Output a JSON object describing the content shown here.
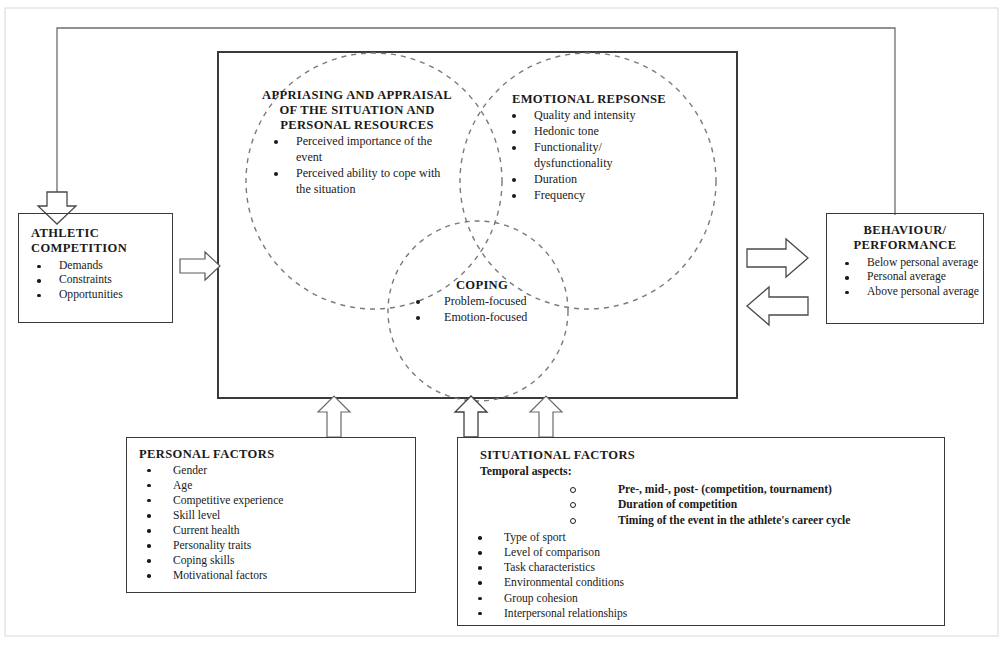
{
  "diagram": {
    "title_present": false,
    "central_box": {
      "name": "appraisal-process-container",
      "circles": [
        {
          "id": "appraisal",
          "heading": "APPRIASING AND APPRAISAL OF THE SITUATION AND PERSONAL RESOURCES",
          "items": [
            "Perceived importance of the event",
            "Perceived ability to cope with the situation"
          ]
        },
        {
          "id": "emotional-response",
          "heading": "EMOTIONAL REPSONSE",
          "items": [
            "Quality and intensity",
            "Hedonic tone",
            "Functionality/ dysfunctionality",
            "Duration",
            "Frequency"
          ]
        },
        {
          "id": "coping",
          "heading": "COPING",
          "items": [
            "Problem-focused",
            "Emotion-focused"
          ]
        }
      ]
    },
    "athletic_competition": {
      "title": "ATHLETIC COMPETITION",
      "items": [
        "Demands",
        "Constraints",
        "Opportunities"
      ]
    },
    "behaviour_performance": {
      "title": "BEHAVIOUR/ PERFORMANCE",
      "items": [
        "Below personal average",
        "Personal average",
        "Above personal average"
      ]
    },
    "personal_factors": {
      "title": "PERSONAL FACTORS",
      "items": [
        "Gender",
        "Age",
        "Competitive experience",
        "Skill level",
        "Current health",
        "Personality traits",
        "Coping skills",
        "Motivational factors"
      ]
    },
    "situational_factors": {
      "title": "SITUATIONAL FACTORS",
      "subheading": "Temporal aspects:",
      "temporal_items": [
        "Pre-, mid-, post- (competition, tournament)",
        "Duration of competition",
        "Timing of the event in the athlete's career cycle"
      ],
      "items": [
        "Type of sport",
        "Level of comparison",
        "Task characteristics",
        "Environmental conditions",
        "Group cohesion",
        "Interpersonal relationships"
      ]
    },
    "connectors": [
      {
        "id": "feedback-loop",
        "from": "behaviour-performance",
        "to": "athletic-competition",
        "style": "thin-line-with-block-arrow"
      },
      {
        "id": "competition-to-appraisal",
        "from": "athletic-competition",
        "to": "central-box",
        "style": "block-arrow-right"
      },
      {
        "id": "appraisal-to-behaviour",
        "from": "central-box",
        "to": "behaviour-performance",
        "style": "block-arrow-right"
      },
      {
        "id": "behaviour-to-appraisal",
        "from": "behaviour-performance",
        "to": "central-box",
        "style": "block-arrow-left"
      },
      {
        "id": "personal-factors-up",
        "from": "personal-factors",
        "to": "central-box",
        "style": "block-arrow-up"
      },
      {
        "id": "situational-factors-up-1",
        "from": "situational-factors",
        "to": "central-box",
        "style": "block-arrow-up"
      },
      {
        "id": "situational-factors-up-2",
        "from": "situational-factors",
        "to": "central-box",
        "style": "block-arrow-up"
      }
    ],
    "colors": {
      "line": "#3a3a3a",
      "dashed_circle": "#6b6b6b",
      "text": "#1a1a1a",
      "frame": "#b9b9b9"
    }
  }
}
